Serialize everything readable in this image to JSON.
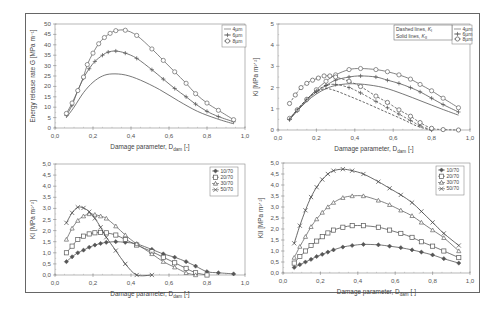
{
  "chart_data": [
    {
      "id": "top-left",
      "type": "line",
      "title": "",
      "xlabel": "Damage parameter, D_dam [-]",
      "ylabel": "Energy release rate G [MPa m^-1]",
      "xlim": [
        0.0,
        1.0
      ],
      "ylim": [
        0,
        50
      ],
      "xticks": [
        "0,0",
        "0,2",
        "0,4",
        "0,6",
        "0,8",
        "1,0"
      ],
      "yticks": [
        "0",
        "5",
        "10",
        "15",
        "20",
        "25",
        "30",
        "35",
        "40",
        "45",
        "50"
      ],
      "grid": false,
      "legend_position": "top-right",
      "series": [
        {
          "name": "4µm",
          "marker": "none",
          "dashed": false,
          "x": [
            0.06,
            0.1,
            0.15,
            0.2,
            0.25,
            0.3,
            0.37,
            0.45,
            0.55,
            0.65,
            0.75,
            0.85,
            0.94
          ],
          "y": [
            5,
            10,
            17,
            22,
            25,
            26,
            25.5,
            23,
            18.5,
            13,
            8,
            4.5,
            2
          ]
        },
        {
          "name": "6µm",
          "marker": "plus",
          "dashed": false,
          "x": [
            0.06,
            0.09,
            0.12,
            0.15,
            0.18,
            0.21,
            0.25,
            0.28,
            0.32,
            0.37,
            0.43,
            0.51,
            0.57,
            0.63,
            0.69,
            0.74,
            0.8,
            0.86,
            0.94
          ],
          "y": [
            6,
            11,
            18,
            24,
            28.5,
            32,
            35,
            36.5,
            37,
            36,
            33.5,
            28,
            23.5,
            19,
            15,
            11.5,
            8,
            5.5,
            3
          ]
        },
        {
          "name": "8µm",
          "marker": "circle",
          "dashed": false,
          "x": [
            0.06,
            0.09,
            0.12,
            0.15,
            0.17,
            0.2,
            0.23,
            0.26,
            0.29,
            0.32,
            0.37,
            0.43,
            0.51,
            0.57,
            0.63,
            0.69,
            0.74,
            0.8,
            0.86,
            0.94
          ],
          "y": [
            7,
            12,
            18,
            24.5,
            30.5,
            36,
            40.5,
            43.5,
            45.5,
            46.8,
            47,
            44.5,
            38,
            32.5,
            27,
            21.5,
            16.5,
            12,
            8.5,
            4
          ]
        }
      ]
    },
    {
      "id": "top-right",
      "type": "line",
      "title": "",
      "xlabel": "Damage parameter, D_dam [-]",
      "ylabel": "K_i [MPa m^1/2]",
      "xlim": [
        0.0,
        1.0
      ],
      "ylim": [
        0,
        5
      ],
      "xticks": [
        "0,0",
        "0,2",
        "0,4",
        "0,6",
        "0,8",
        "1,0"
      ],
      "yticks": [
        "0",
        "1",
        "2",
        "3",
        "4",
        "5"
      ],
      "grid": false,
      "legend_position": "top-right",
      "annotation": [
        "Dashed lines, K_I",
        "Solid lines, K_II"
      ],
      "series": [
        {
          "name": "4µm K_II",
          "marker": "none",
          "dashed": false,
          "x": [
            0.06,
            0.1,
            0.15,
            0.2,
            0.25,
            0.3,
            0.37,
            0.45,
            0.55,
            0.65,
            0.75,
            0.85,
            0.94
          ],
          "y": [
            0.5,
            0.9,
            1.35,
            1.7,
            1.95,
            2.1,
            2.18,
            2.15,
            2.0,
            1.7,
            1.35,
            1.0,
            0.7
          ]
        },
        {
          "name": "6µm K_II",
          "marker": "plus",
          "dashed": false,
          "x": [
            0.06,
            0.1,
            0.15,
            0.2,
            0.25,
            0.3,
            0.37,
            0.43,
            0.51,
            0.57,
            0.63,
            0.69,
            0.74,
            0.8,
            0.86,
            0.94
          ],
          "y": [
            0.5,
            0.9,
            1.4,
            1.8,
            2.1,
            2.35,
            2.5,
            2.55,
            2.5,
            2.35,
            2.2,
            2.0,
            1.8,
            1.5,
            1.2,
            0.85
          ]
        },
        {
          "name": "8µm K_II",
          "marker": "circle",
          "dashed": false,
          "x": [
            0.06,
            0.1,
            0.15,
            0.2,
            0.25,
            0.3,
            0.37,
            0.43,
            0.51,
            0.57,
            0.63,
            0.69,
            0.74,
            0.8,
            0.86,
            0.94
          ],
          "y": [
            0.55,
            0.95,
            1.45,
            1.9,
            2.3,
            2.6,
            2.85,
            2.9,
            2.85,
            2.75,
            2.6,
            2.4,
            2.15,
            1.85,
            1.5,
            1.05
          ]
        },
        {
          "name": "4µm K_I",
          "marker": "none",
          "dashed": true,
          "x": [
            0.06,
            0.1,
            0.15,
            0.2,
            0.25,
            0.3,
            0.37,
            0.45,
            0.55,
            0.65,
            0.72,
            0.78,
            0.8
          ],
          "y": [
            0.5,
            0.95,
            1.45,
            1.8,
            1.95,
            1.85,
            1.6,
            1.3,
            0.9,
            0.5,
            0.2,
            0.03,
            0
          ]
        },
        {
          "name": "6µm K_I",
          "marker": "plus",
          "dashed": true,
          "x": [
            0.06,
            0.1,
            0.15,
            0.2,
            0.25,
            0.3,
            0.37,
            0.43,
            0.51,
            0.57,
            0.63,
            0.69,
            0.74,
            0.8
          ],
          "y": [
            0.5,
            0.95,
            1.45,
            1.85,
            2.1,
            2.15,
            2.0,
            1.75,
            1.35,
            1.05,
            0.75,
            0.45,
            0.2,
            0
          ]
        },
        {
          "name": "8µm K_I",
          "marker": "circle",
          "dashed": true,
          "x": [
            0.06,
            0.09,
            0.12,
            0.15,
            0.18,
            0.21,
            0.24,
            0.27,
            0.3,
            0.37,
            0.43,
            0.51,
            0.57,
            0.63,
            0.69,
            0.74,
            0.8,
            0.86,
            0.94
          ],
          "y": [
            1.25,
            1.65,
            2.0,
            2.2,
            2.35,
            2.45,
            2.55,
            2.55,
            2.5,
            2.3,
            2.05,
            1.6,
            1.3,
            0.95,
            0.65,
            0.35,
            0.08,
            0.02,
            0
          ]
        }
      ]
    },
    {
      "id": "bottom-left",
      "type": "line",
      "title": "",
      "xlabel": "Damage parameter, D_dam [-]",
      "ylabel": "K_I [MPa m^1/2]",
      "xlim": [
        0.0,
        1.0
      ],
      "ylim": [
        0.0,
        5.0
      ],
      "xticks": [
        "0,0",
        "0,2",
        "0,4",
        "0,6",
        "0,8",
        "1,0"
      ],
      "yticks": [
        "0,0",
        "0,5",
        "1,0",
        "1,5",
        "2,0",
        "2,5",
        "3,0",
        "3,5",
        "4,0",
        "4,5",
        "5,0"
      ],
      "grid": false,
      "legend_position": "top-right",
      "series": [
        {
          "name": "10/70",
          "marker": "diamond",
          "x": [
            0.06,
            0.09,
            0.12,
            0.15,
            0.18,
            0.21,
            0.24,
            0.27,
            0.32,
            0.37,
            0.43,
            0.51,
            0.57,
            0.63,
            0.69,
            0.74,
            0.8,
            0.86,
            0.94
          ],
          "y": [
            0.6,
            0.82,
            1.0,
            1.12,
            1.25,
            1.35,
            1.42,
            1.47,
            1.5,
            1.47,
            1.4,
            1.15,
            0.95,
            0.8,
            0.6,
            0.4,
            0.15,
            0.1,
            0.05
          ]
        },
        {
          "name": "20/70",
          "marker": "square",
          "x": [
            0.06,
            0.09,
            0.12,
            0.15,
            0.18,
            0.21,
            0.24,
            0.27,
            0.32,
            0.37,
            0.43,
            0.51,
            0.57,
            0.63,
            0.69,
            0.74,
            0.8
          ],
          "y": [
            1.0,
            1.3,
            1.6,
            1.75,
            1.85,
            1.9,
            1.92,
            1.9,
            1.8,
            1.6,
            1.35,
            1.05,
            0.8,
            0.55,
            0.3,
            0.1,
            0
          ]
        },
        {
          "name": "30/70",
          "marker": "triangle",
          "x": [
            0.06,
            0.09,
            0.12,
            0.15,
            0.18,
            0.21,
            0.24,
            0.27,
            0.32,
            0.37,
            0.43,
            0.51,
            0.57,
            0.63,
            0.69,
            0.74
          ],
          "y": [
            1.6,
            2.1,
            2.45,
            2.65,
            2.75,
            2.72,
            2.65,
            2.55,
            2.2,
            1.8,
            1.4,
            0.95,
            0.6,
            0.35,
            0.1,
            0
          ]
        },
        {
          "name": "50/70",
          "marker": "cross",
          "x": [
            0.06,
            0.09,
            0.12,
            0.15,
            0.18,
            0.21,
            0.24,
            0.27,
            0.32,
            0.37,
            0.43,
            0.51
          ],
          "y": [
            2.35,
            2.8,
            3.05,
            3.02,
            2.85,
            2.55,
            2.15,
            1.7,
            1.1,
            0.5,
            0,
            0
          ]
        }
      ]
    },
    {
      "id": "bottom-right",
      "type": "line",
      "title": "",
      "xlabel": "Damage parameter, D_dam [-]",
      "ylabel": "K_II [MPa m^1/2]",
      "xlim": [
        0.0,
        1.0
      ],
      "ylim": [
        0.0,
        5.0
      ],
      "xticks": [
        "0,0",
        "0,2",
        "0,4",
        "0,6",
        "0,8",
        "1,0"
      ],
      "yticks": [
        "0,0",
        "0,5",
        "1,0",
        "1,5",
        "2,0",
        "2,5",
        "3,0",
        "3,5",
        "4,0",
        "4,5",
        "5,0"
      ],
      "grid": false,
      "legend_position": "top-right",
      "series": [
        {
          "name": "10/70",
          "marker": "diamond",
          "x": [
            0.06,
            0.09,
            0.12,
            0.15,
            0.18,
            0.21,
            0.24,
            0.27,
            0.32,
            0.37,
            0.43,
            0.51,
            0.57,
            0.63,
            0.69,
            0.74,
            0.8,
            0.86,
            0.94
          ],
          "y": [
            0.25,
            0.38,
            0.5,
            0.62,
            0.75,
            0.85,
            0.95,
            1.05,
            1.18,
            1.25,
            1.3,
            1.28,
            1.22,
            1.15,
            1.05,
            0.95,
            0.82,
            0.65,
            0.45
          ]
        },
        {
          "name": "20/70",
          "marker": "square",
          "x": [
            0.06,
            0.09,
            0.12,
            0.15,
            0.18,
            0.21,
            0.24,
            0.27,
            0.32,
            0.37,
            0.43,
            0.51,
            0.57,
            0.63,
            0.69,
            0.74,
            0.8,
            0.86,
            0.94
          ],
          "y": [
            0.45,
            0.75,
            1.0,
            1.25,
            1.45,
            1.65,
            1.82,
            1.95,
            2.08,
            2.15,
            2.15,
            2.08,
            1.95,
            1.8,
            1.62,
            1.42,
            1.22,
            1.0,
            0.7
          ]
        },
        {
          "name": "30/70",
          "marker": "triangle",
          "x": [
            0.06,
            0.09,
            0.12,
            0.15,
            0.18,
            0.21,
            0.24,
            0.27,
            0.32,
            0.37,
            0.43,
            0.51,
            0.57,
            0.63,
            0.69,
            0.74,
            0.8,
            0.86,
            0.94
          ],
          "y": [
            0.7,
            1.2,
            1.65,
            2.1,
            2.45,
            2.75,
            3.0,
            3.2,
            3.42,
            3.5,
            3.5,
            3.3,
            3.1,
            2.85,
            2.6,
            2.3,
            1.95,
            1.6,
            1.0
          ]
        },
        {
          "name": "50/70",
          "marker": "cross",
          "x": [
            0.06,
            0.09,
            0.12,
            0.15,
            0.18,
            0.21,
            0.24,
            0.27,
            0.32,
            0.37,
            0.43,
            0.51,
            0.57,
            0.63,
            0.69,
            0.74,
            0.8,
            0.86,
            0.94
          ],
          "y": [
            1.35,
            2.15,
            2.85,
            3.45,
            3.9,
            4.25,
            4.5,
            4.65,
            4.72,
            4.65,
            4.5,
            4.15,
            3.85,
            3.55,
            3.2,
            2.8,
            2.3,
            1.8,
            1.25
          ]
        }
      ]
    }
  ],
  "layout": {
    "panels": [
      {
        "x0": 55,
        "x1": 245,
        "y0": 128,
        "y1": 24,
        "legend": {
          "x": 222,
          "y": 25,
          "w": 24,
          "h": 22
        }
      },
      {
        "x0": 278,
        "x1": 470,
        "y0": 130,
        "y1": 24,
        "legend": {
          "x": 452,
          "y": 25,
          "w": 20,
          "h": 19
        },
        "annotation_box": {
          "x": 394,
          "y": 25,
          "w": 58,
          "h": 15
        }
      },
      {
        "x0": 55,
        "x1": 245,
        "y0": 275,
        "y1": 164,
        "legend": {
          "x": 210,
          "y": 167,
          "w": 28,
          "h": 29
        }
      },
      {
        "x0": 283,
        "x1": 470,
        "y0": 273,
        "y1": 163,
        "legend": {
          "x": 436,
          "y": 166,
          "w": 28,
          "h": 29
        }
      }
    ]
  }
}
